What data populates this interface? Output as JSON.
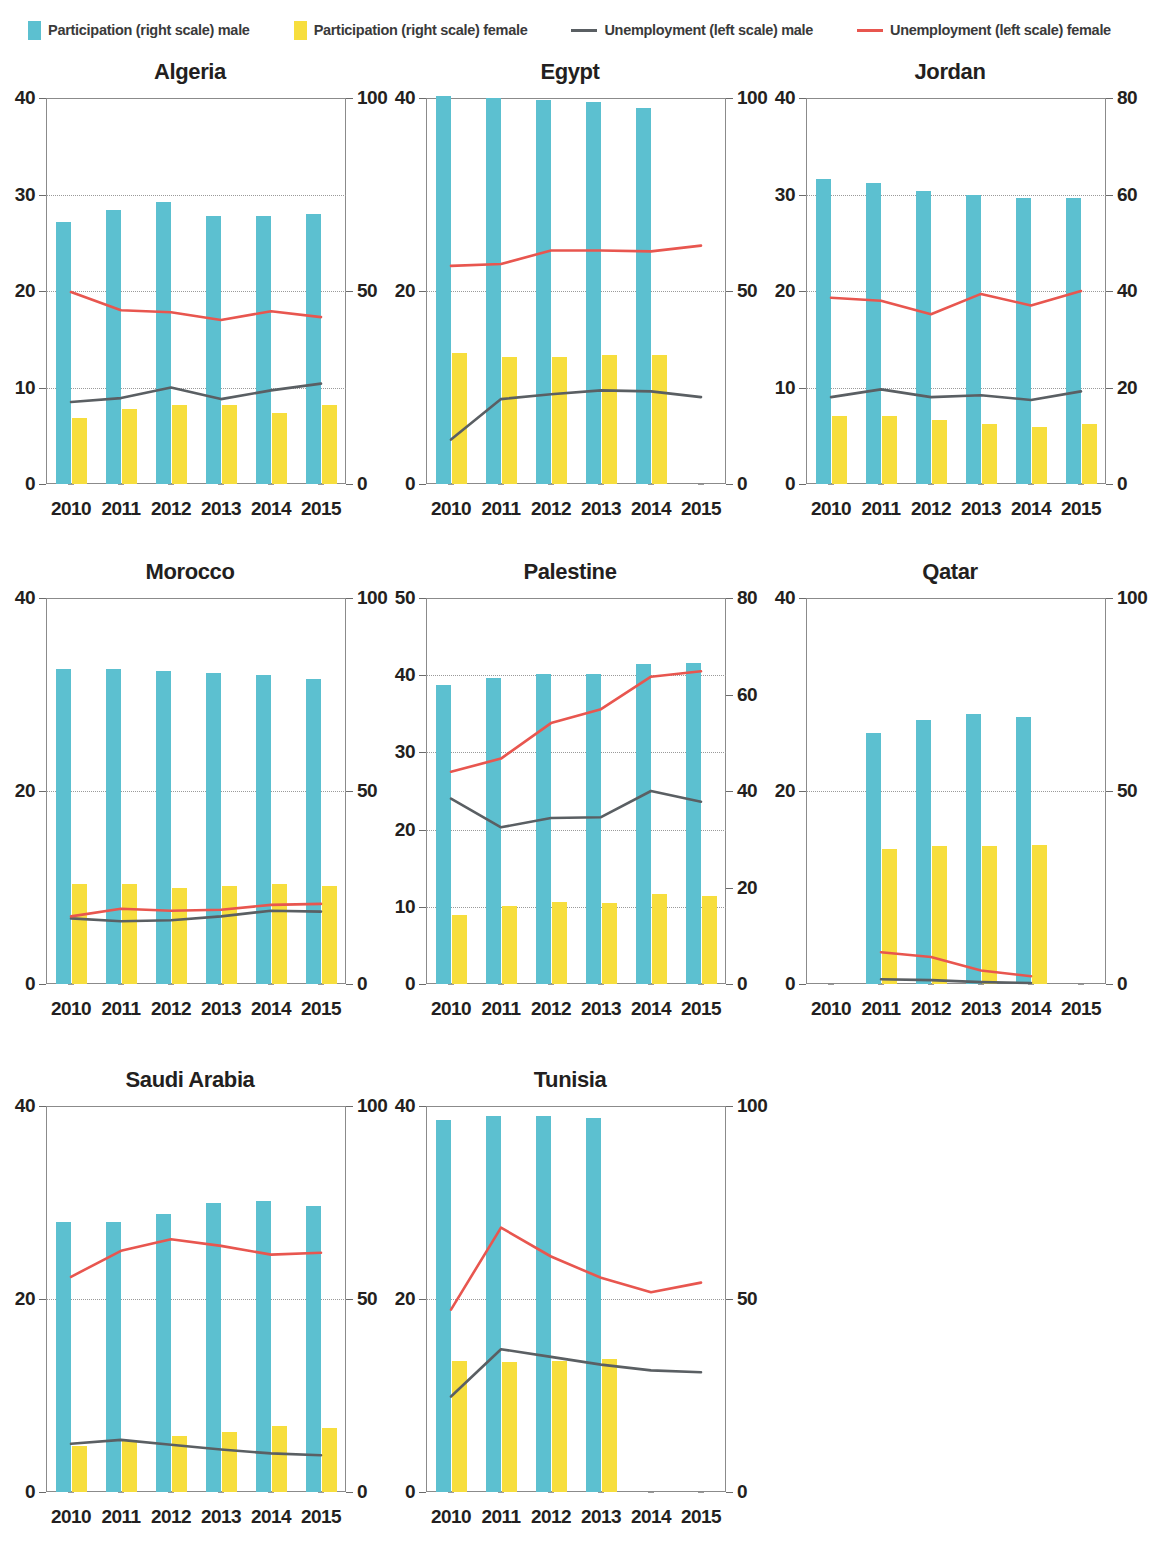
{
  "legend": {
    "items": [
      {
        "type": "swatch",
        "name": "participation-male",
        "label": "Participation (right scale) male",
        "color": "#5cc0d0"
      },
      {
        "type": "swatch",
        "name": "participation-female",
        "label": "Participation (right scale) female",
        "color": "#f7de3d"
      },
      {
        "type": "line",
        "name": "unemployment-male",
        "label": "Unemployment (left scale) male",
        "color": "#5a5f63"
      },
      {
        "type": "line",
        "name": "unemployment-female",
        "label": "Unemployment (left scale) female",
        "color": "#e8564f"
      }
    ]
  },
  "colors": {
    "participation_male": "#5cc0d0",
    "participation_female": "#f7de3d",
    "unemployment_male": "#5a5f63",
    "unemployment_female": "#e8564f",
    "frame": "#8b8b8b",
    "gridline": "#9a9a9a"
  },
  "chart_data": [
    {
      "type": "bar",
      "title": "Algeria",
      "x": [
        "2010",
        "2011",
        "2012",
        "2013",
        "2014",
        "2015"
      ],
      "xlabel": "",
      "ylabel": "",
      "ylim": [
        0,
        40
      ],
      "yticks": [
        0,
        10,
        20,
        30,
        40
      ],
      "y2lim": [
        0,
        100
      ],
      "y2ticks": [
        0,
        50,
        100
      ],
      "grid": true,
      "series": [
        {
          "name": "Participation (right scale) male",
          "axis": "right",
          "kind": "bar",
          "values": [
            68.0,
            71.0,
            73.0,
            69.5,
            69.5,
            70.0
          ]
        },
        {
          "name": "Participation (right scale) female",
          "axis": "right",
          "kind": "bar",
          "values": [
            17.0,
            19.5,
            20.5,
            20.5,
            18.5,
            20.5
          ]
        },
        {
          "name": "Unemployment (left scale) male",
          "axis": "left",
          "kind": "line",
          "values": [
            8.5,
            8.9,
            10.0,
            8.8,
            9.7,
            10.4
          ]
        },
        {
          "name": "Unemployment (left scale) female",
          "axis": "left",
          "kind": "line",
          "values": [
            19.9,
            18.0,
            17.8,
            17.0,
            17.9,
            17.3
          ]
        }
      ]
    },
    {
      "type": "bar",
      "title": "Egypt",
      "x": [
        "2010",
        "2011",
        "2012",
        "2013",
        "2014",
        "2015"
      ],
      "xlabel": "",
      "ylabel": "",
      "ylim": [
        0,
        40
      ],
      "yticks": [
        0,
        20,
        40
      ],
      "y2lim": [
        0,
        100
      ],
      "y2ticks": [
        0,
        50,
        100
      ],
      "grid": true,
      "series": [
        {
          "name": "Participation (right scale) male",
          "axis": "right",
          "kind": "bar",
          "values": [
            100.5,
            100.0,
            99.5,
            99.0,
            97.5,
            null
          ]
        },
        {
          "name": "Participation (right scale) female",
          "axis": "right",
          "kind": "bar",
          "values": [
            34.0,
            33.0,
            32.8,
            33.5,
            33.5,
            null
          ]
        },
        {
          "name": "Unemployment (left scale) male",
          "axis": "left",
          "kind": "line",
          "values": [
            4.6,
            8.8,
            9.3,
            9.7,
            9.6,
            9.0
          ]
        },
        {
          "name": "Unemployment (left scale) female",
          "axis": "left",
          "kind": "line",
          "values": [
            22.6,
            22.8,
            24.2,
            24.2,
            24.1,
            24.7
          ]
        }
      ]
    },
    {
      "type": "bar",
      "title": "Jordan",
      "x": [
        "2010",
        "2011",
        "2012",
        "2013",
        "2014",
        "2015"
      ],
      "xlabel": "",
      "ylabel": "",
      "ylim": [
        0,
        40
      ],
      "yticks": [
        0,
        10,
        20,
        30,
        40
      ],
      "y2lim": [
        0,
        80
      ],
      "y2ticks": [
        0,
        20,
        40,
        60,
        80
      ],
      "grid": true,
      "series": [
        {
          "name": "Participation (right scale) male",
          "axis": "right",
          "kind": "bar",
          "values": [
            63.3,
            62.4,
            60.8,
            59.9,
            59.3,
            59.3
          ]
        },
        {
          "name": "Participation (right scale) female",
          "axis": "right",
          "kind": "bar",
          "values": [
            14.0,
            14.0,
            13.3,
            12.4,
            11.9,
            12.5
          ]
        },
        {
          "name": "Unemployment (left scale) male",
          "axis": "left",
          "kind": "line",
          "values": [
            9.0,
            9.8,
            9.0,
            9.2,
            8.7,
            9.6
          ]
        },
        {
          "name": "Unemployment (left scale) female",
          "axis": "left",
          "kind": "line",
          "values": [
            19.3,
            19.0,
            17.6,
            19.7,
            18.5,
            20.0
          ]
        }
      ]
    },
    {
      "type": "bar",
      "title": "Morocco",
      "x": [
        "2010",
        "2011",
        "2012",
        "2013",
        "2014",
        "2015"
      ],
      "xlabel": "",
      "ylabel": "",
      "ylim": [
        0,
        40
      ],
      "yticks": [
        0,
        20,
        40
      ],
      "y2lim": [
        0,
        100
      ],
      "y2ticks": [
        0,
        50,
        100
      ],
      "grid": true,
      "series": [
        {
          "name": "Participation (right scale) male",
          "axis": "right",
          "kind": "bar",
          "values": [
            81.5,
            81.5,
            81.0,
            80.5,
            80.0,
            79.0
          ]
        },
        {
          "name": "Participation (right scale) female",
          "axis": "right",
          "kind": "bar",
          "values": [
            26.0,
            26.0,
            25.0,
            25.5,
            25.8,
            25.5
          ]
        },
        {
          "name": "Unemployment (left scale) male",
          "axis": "left",
          "kind": "line",
          "values": [
            6.8,
            6.5,
            6.6,
            7.0,
            7.6,
            7.5
          ]
        },
        {
          "name": "Unemployment (left scale) female",
          "axis": "left",
          "kind": "line",
          "values": [
            7.0,
            7.8,
            7.6,
            7.7,
            8.2,
            8.3
          ]
        }
      ]
    },
    {
      "type": "bar",
      "title": "Palestine",
      "x": [
        "2010",
        "2011",
        "2012",
        "2013",
        "2014",
        "2015"
      ],
      "xlabel": "",
      "ylabel": "",
      "ylim": [
        0,
        50
      ],
      "yticks": [
        0,
        10,
        20,
        30,
        40,
        50
      ],
      "y2lim": [
        0,
        80
      ],
      "y2ticks": [
        0,
        20,
        40,
        60,
        80
      ],
      "grid": true,
      "series": [
        {
          "name": "Participation (right scale) male",
          "axis": "right",
          "kind": "bar",
          "values": [
            62.0,
            63.5,
            64.2,
            64.2,
            66.3,
            66.6
          ]
        },
        {
          "name": "Participation (right scale) female",
          "axis": "right",
          "kind": "bar",
          "values": [
            14.3,
            16.1,
            16.9,
            16.8,
            18.6,
            18.3
          ]
        },
        {
          "name": "Unemployment (left scale) male",
          "axis": "left",
          "kind": "line",
          "values": [
            24.0,
            20.3,
            21.5,
            21.6,
            25.0,
            23.6
          ]
        },
        {
          "name": "Unemployment (left scale) female",
          "axis": "left",
          "kind": "line",
          "values": [
            27.5,
            29.2,
            33.8,
            35.6,
            39.8,
            40.5
          ]
        }
      ]
    },
    {
      "type": "bar",
      "title": "Qatar",
      "x": [
        "2010",
        "2011",
        "2012",
        "2013",
        "2014",
        "2015"
      ],
      "xlabel": "",
      "ylabel": "",
      "ylim": [
        0,
        40
      ],
      "yticks": [
        0,
        20,
        40
      ],
      "y2lim": [
        0,
        100
      ],
      "y2ticks": [
        0,
        50,
        100
      ],
      "grid": true,
      "series": [
        {
          "name": "Participation (right scale) male",
          "axis": "right",
          "kind": "bar",
          "values": [
            null,
            65.0,
            68.5,
            70.0,
            69.3,
            null
          ]
        },
        {
          "name": "Participation (right scale) female",
          "axis": "right",
          "kind": "bar",
          "values": [
            null,
            35.0,
            35.8,
            35.7,
            35.9,
            null
          ]
        },
        {
          "name": "Unemployment (left scale) male",
          "axis": "left",
          "kind": "line",
          "values": [
            null,
            0.5,
            0.4,
            0.2,
            0.1,
            null
          ]
        },
        {
          "name": "Unemployment (left scale) female",
          "axis": "left",
          "kind": "line",
          "values": [
            null,
            3.3,
            2.8,
            1.4,
            0.8,
            null
          ]
        }
      ]
    },
    {
      "type": "bar",
      "title": "Saudi Arabia",
      "x": [
        "2010",
        "2011",
        "2012",
        "2013",
        "2014",
        "2015"
      ],
      "xlabel": "",
      "ylabel": "",
      "ylim": [
        0,
        40
      ],
      "yticks": [
        0,
        20,
        40
      ],
      "y2lim": [
        0,
        100
      ],
      "y2ticks": [
        0,
        50,
        100
      ],
      "grid": true,
      "series": [
        {
          "name": "Participation (right scale) male",
          "axis": "right",
          "kind": "bar",
          "values": [
            70.0,
            70.0,
            72.0,
            75.0,
            75.5,
            74.0
          ]
        },
        {
          "name": "Participation (right scale) female",
          "axis": "right",
          "kind": "bar",
          "values": [
            12.0,
            13.5,
            14.5,
            15.5,
            17.0,
            16.5
          ]
        },
        {
          "name": "Unemployment (left scale) male",
          "axis": "left",
          "kind": "line",
          "values": [
            5.0,
            5.4,
            4.9,
            4.4,
            4.0,
            3.8
          ]
        },
        {
          "name": "Unemployment (left scale) female",
          "axis": "left",
          "kind": "line",
          "values": [
            22.3,
            25.0,
            26.2,
            25.5,
            24.6,
            24.8
          ]
        }
      ]
    },
    {
      "type": "bar",
      "title": "Tunisia",
      "x": [
        "2010",
        "2011",
        "2012",
        "2013",
        "2014",
        "2015"
      ],
      "xlabel": "",
      "ylabel": "",
      "ylim": [
        0,
        40
      ],
      "yticks": [
        0,
        20,
        40
      ],
      "y2lim": [
        0,
        100
      ],
      "y2ticks": [
        0,
        50,
        100
      ],
      "grid": true,
      "series": [
        {
          "name": "Participation (right scale) male",
          "axis": "right",
          "kind": "bar",
          "values": [
            96.5,
            97.3,
            97.3,
            97.0,
            null,
            null
          ]
        },
        {
          "name": "Participation (right scale) female",
          "axis": "right",
          "kind": "bar",
          "values": [
            34.0,
            33.8,
            34.0,
            34.5,
            null,
            null
          ]
        },
        {
          "name": "Unemployment (left scale) male",
          "axis": "left",
          "kind": "line",
          "values": [
            9.9,
            14.8,
            14.0,
            13.2,
            12.6,
            12.4
          ]
        },
        {
          "name": "Unemployment (left scale) female",
          "axis": "left",
          "kind": "line",
          "values": [
            18.9,
            27.4,
            24.4,
            22.2,
            20.7,
            21.7
          ]
        }
      ]
    }
  ]
}
